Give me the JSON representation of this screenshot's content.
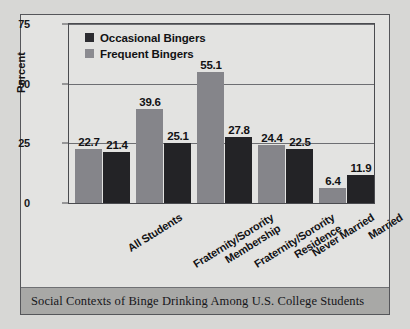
{
  "caption": "Social Contexts of Binge Drinking Among U.S. College Students",
  "legend": {
    "items": [
      {
        "label": "Occasional Bingers",
        "color": "#2c2c30",
        "swatch_icon": "square-swatch-icon"
      },
      {
        "label": "Frequent Bingers",
        "color": "#8b8b90",
        "swatch_icon": "square-swatch-icon"
      }
    ]
  },
  "axis": {
    "y_title": "Percent",
    "y_ticks": [
      "0",
      "25",
      "50",
      "75"
    ]
  },
  "colors": {
    "frequent": "#85858a",
    "occasional": "#232326",
    "page_background": "#d7d7d5",
    "panel_background": "#e3e3e1",
    "caption_bar": "#a8a8a6",
    "frame": "#4a4b4f"
  },
  "chart_data": {
    "type": "bar",
    "title": "Social Contexts of Binge Drinking Among U.S. College Students",
    "xlabel": "",
    "ylabel": "Percent",
    "ylim": [
      0,
      75
    ],
    "yticks": [
      0,
      25,
      50,
      75
    ],
    "grid": true,
    "legend_position": "top-left",
    "categories": [
      "All Students",
      "Fraternity/Sorority Membership",
      "Fraternity/Sorority Residence",
      "Never Married",
      "Married"
    ],
    "category_lines": [
      [
        "All Students"
      ],
      [
        "Fraternity/Sorority",
        "Membership"
      ],
      [
        "Fraternity/Sorority",
        "Residence"
      ],
      [
        "Never Married"
      ],
      [
        "Married"
      ]
    ],
    "series": [
      {
        "name": "Frequent Bingers",
        "color": "#85858a",
        "values": [
          22.7,
          39.6,
          55.1,
          24.4,
          6.4
        ]
      },
      {
        "name": "Occasional Bingers",
        "color": "#232326",
        "values": [
          21.4,
          25.1,
          27.8,
          22.5,
          11.9
        ]
      }
    ],
    "value_labels": [
      [
        "22.7",
        "21.4"
      ],
      [
        "39.6",
        "25.1"
      ],
      [
        "55.1",
        "27.8"
      ],
      [
        "24.4",
        "22.5"
      ],
      [
        "6.4",
        "11.9"
      ]
    ]
  }
}
